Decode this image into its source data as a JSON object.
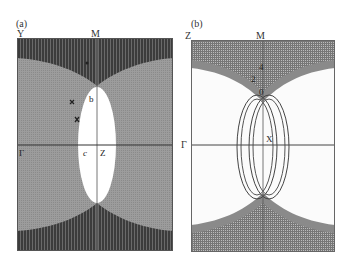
{
  "figure": {
    "panels": [
      {
        "id": "a",
        "tag": "(a)",
        "corner_top_left": "Y",
        "top_center": "M",
        "left_mid": "Γ",
        "inner_labels": {
          "b": "b",
          "c": "c",
          "z": "Z"
        },
        "colors": {
          "background": "#9a9a9a",
          "hatched_region": "#4a4a4a",
          "pocket": "#ffffff"
        }
      },
      {
        "id": "b",
        "tag": "(b)",
        "corner_top_left": "Z",
        "top_center": "M",
        "left_mid": "Γ",
        "inner_labels": {
          "x": "X",
          "two": "2",
          "four": "4",
          "zero": "0"
        },
        "colors": {
          "background": "#ffffff",
          "hatched_region": "#6a6a6a",
          "band": "#8a8a8a"
        }
      }
    ]
  }
}
